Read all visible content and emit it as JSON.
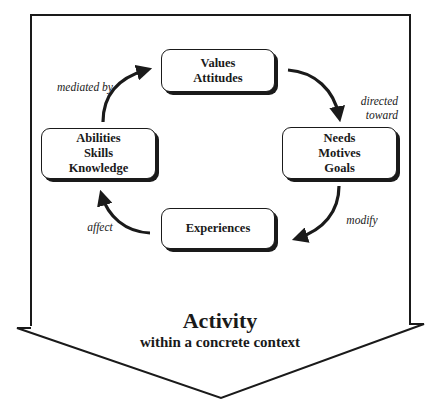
{
  "header": {
    "cut_off_title": "Psychological Dynamics"
  },
  "cycle": {
    "nodes": [
      {
        "id": "values",
        "lines": [
          "Values",
          "Attitudes"
        ]
      },
      {
        "id": "needs",
        "lines": [
          "Needs",
          "Motives",
          "Goals"
        ]
      },
      {
        "id": "experiences",
        "lines": [
          "Experiences"
        ]
      },
      {
        "id": "abilities",
        "lines": [
          "Abilities",
          "Skills",
          "Knowledge"
        ]
      }
    ],
    "edges": [
      {
        "from": "values",
        "to": "needs",
        "label_lines": [
          "directed",
          "toward"
        ]
      },
      {
        "from": "needs",
        "to": "experiences",
        "label_lines": [
          "modify"
        ]
      },
      {
        "from": "experiences",
        "to": "abilities",
        "label_lines": [
          "affect"
        ]
      },
      {
        "from": "abilities",
        "to": "values",
        "label_lines": [
          "mediated by"
        ]
      }
    ]
  },
  "activity": {
    "title": "Activity",
    "subtitle": "within a concrete context"
  },
  "colors": {
    "stroke": "#1a1a1a",
    "background": "#ffffff"
  }
}
